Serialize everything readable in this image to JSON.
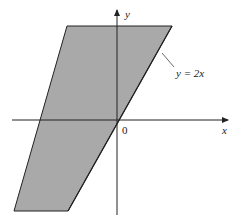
{
  "diagram": {
    "type": "shaded-region",
    "region": {
      "fill": "#a9a9a9",
      "stroke": "#222222",
      "vertices": [
        [
          67,
          26
        ],
        [
          172,
          26
        ],
        [
          68,
          211
        ],
        [
          14,
          211
        ]
      ],
      "description": "parallelogram region bounded on the right by y = 2x"
    },
    "axes": {
      "x_label": "x",
      "y_label": "y",
      "origin_label": "0"
    },
    "boundary_label": "y = 2x"
  }
}
